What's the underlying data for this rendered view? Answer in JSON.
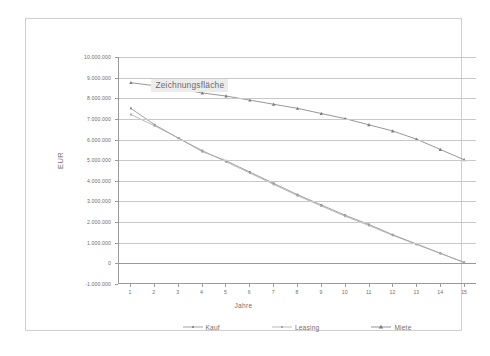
{
  "chart_data": {
    "type": "line",
    "title": "",
    "xlabel": "Jahre",
    "ylabel": "EUR",
    "xlim": [
      0.5,
      15.5
    ],
    "ylim": [
      -1000000,
      10000000
    ],
    "grid": true,
    "legend_position": "bottom",
    "x": [
      1,
      2,
      3,
      4,
      5,
      6,
      7,
      8,
      9,
      10,
      11,
      12,
      13,
      14,
      15
    ],
    "categories": [
      "1",
      "2",
      "3",
      "4",
      "5",
      "6",
      "7",
      "8",
      "9",
      "10",
      "11",
      "12",
      "13",
      "14",
      "15"
    ],
    "y_tick_labels": [
      "10.000.000",
      "9.000.000",
      "8.000.000",
      "7.000.000",
      "6.000.000",
      "5.000.000",
      "4.000.000",
      "3.000.000",
      "2.000.000",
      "1.000.000",
      "0",
      "-1.000.000"
    ],
    "y_tick_values": [
      10000000,
      9000000,
      8000000,
      7000000,
      6000000,
      5000000,
      4000000,
      3000000,
      2000000,
      1000000,
      0,
      -1000000
    ],
    "series": [
      {
        "name": "Kauf",
        "color": "#8c8c8c",
        "marker": "dot",
        "values": [
          7500000,
          6700000,
          6050000,
          5400000,
          4950000,
          4400000,
          3850000,
          3300000,
          2800000,
          2300000,
          1850000,
          1350000,
          900000,
          450000,
          0
        ]
      },
      {
        "name": "Leasing",
        "color": "#a8a8a8",
        "marker": "dot",
        "values": [
          7200000,
          6650000,
          6050000,
          5450000,
          4900000,
          4350000,
          3800000,
          3250000,
          2750000,
          2250000,
          1800000,
          1320000,
          880000,
          440000,
          0
        ]
      },
      {
        "name": "Miete",
        "color": "#7c7c7c",
        "marker": "triangle",
        "values": [
          8750000,
          8600000,
          8450000,
          8250000,
          8100000,
          7900000,
          7700000,
          7500000,
          7250000,
          7000000,
          6700000,
          6400000,
          6000000,
          5500000,
          5000000
        ]
      }
    ]
  },
  "tooltip": {
    "label": "Zeichnungsfläche"
  },
  "legend": {
    "items": [
      {
        "label": "Kauf"
      },
      {
        "label": "Leasing"
      },
      {
        "label": "Miete"
      }
    ]
  },
  "axes": {
    "y_title": "EUR",
    "x_title": "Jahre"
  },
  "caption": {
    "text": ""
  }
}
